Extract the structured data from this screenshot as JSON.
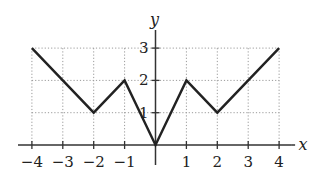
{
  "chart_data": {
    "type": "line",
    "title": "",
    "xlabel": "x",
    "ylabel": "y",
    "xlim": [
      -4,
      4
    ],
    "ylim": [
      0,
      3
    ],
    "grid": true,
    "grid_style": "dotted",
    "x_ticks": [
      -4,
      -3,
      -2,
      -1,
      1,
      2,
      3,
      4
    ],
    "x_tick_labels": [
      "−4",
      "−3",
      "−2",
      "−1",
      "1",
      "2",
      "3",
      "4"
    ],
    "y_ticks": [
      1,
      2,
      3
    ],
    "y_tick_labels": [
      "1",
      "2",
      "3"
    ],
    "series": [
      {
        "name": "f(x)",
        "points": [
          [
            -4,
            3
          ],
          [
            -2,
            1
          ],
          [
            -1,
            2
          ],
          [
            0,
            0
          ],
          [
            1,
            2
          ],
          [
            2,
            1
          ],
          [
            4,
            3
          ]
        ],
        "color": "#222222"
      }
    ],
    "legend": null
  },
  "colors": {
    "line": "#222222",
    "axis": "#333333",
    "grid": "#9a9a9a",
    "background": "#ffffff"
  }
}
